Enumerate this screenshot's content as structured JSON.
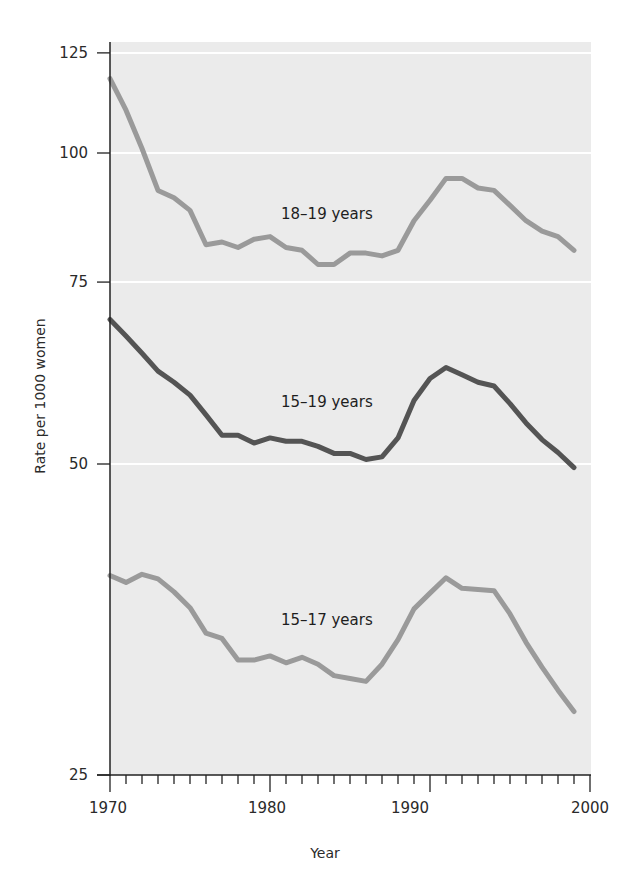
{
  "chart_data": {
    "type": "line",
    "title": "",
    "xlabel": "Year",
    "ylabel": "Rate per 1000 women",
    "y_scale": "log",
    "xlim": [
      1970,
      2000
    ],
    "ylim": [
      25,
      125
    ],
    "x_ticks": [
      1970,
      1980,
      1990,
      2000
    ],
    "x_tick_labels": [
      "1970",
      "1980",
      "1990",
      "2000"
    ],
    "y_ticks": [
      25,
      50,
      75,
      100,
      125
    ],
    "y_tick_labels": [
      "25",
      "50",
      "75",
      "100",
      "125"
    ],
    "grid": "horizontal white lines at y ticks",
    "legend": "inline labels",
    "x": [
      1970,
      1971,
      1972,
      1973,
      1974,
      1975,
      1976,
      1977,
      1978,
      1979,
      1980,
      1981,
      1982,
      1983,
      1984,
      1985,
      1986,
      1987,
      1988,
      1989,
      1990,
      1991,
      1992,
      1993,
      1994,
      1995,
      1996,
      1997,
      1998,
      1999
    ],
    "series": [
      {
        "name": "18–19 years",
        "color": "#9a9a9a",
        "label_position": {
          "x": 1981,
          "y": 87
        },
        "values": [
          118,
          110,
          101,
          92,
          90.5,
          88,
          81.5,
          82,
          81,
          82.5,
          83,
          81,
          80.5,
          78,
          78,
          80,
          80,
          79.5,
          80.5,
          86,
          90,
          94.5,
          94.5,
          92.5,
          92,
          89,
          86,
          84,
          83,
          80.5
        ]
      },
      {
        "name": "15–19 years",
        "color": "#545454",
        "label_position": {
          "x": 1981,
          "y": 60.5
        },
        "values": [
          69,
          66.5,
          64,
          61.5,
          60,
          58.3,
          55.8,
          53.3,
          53.3,
          52.4,
          53,
          52.6,
          52.6,
          52,
          51.2,
          51.2,
          50.5,
          50.8,
          53,
          57.6,
          60.5,
          62,
          61,
          60,
          59.5,
          57.2,
          54.8,
          52.8,
          51.3,
          49.6
        ]
      },
      {
        "name": "15–17 years",
        "color": "#9a9a9a",
        "label_position": {
          "x": 1981,
          "y": 35.5
        },
        "values": [
          39,
          38.4,
          39.1,
          38.7,
          37.6,
          36.3,
          34.3,
          33.9,
          32.3,
          32.3,
          32.6,
          32.1,
          32.5,
          32,
          31.2,
          31,
          30.8,
          32,
          33.8,
          36.2,
          37.5,
          38.8,
          37.9,
          37.8,
          37.7,
          35.8,
          33.6,
          31.8,
          30.2,
          28.8
        ]
      }
    ]
  },
  "labels": {
    "series_1": "18–19 years",
    "series_2": "15–19 years",
    "series_3": "15–17 years",
    "x_axis_title": "Year",
    "y_axis_title": "Rate per 1000 women",
    "x_tick_1970": "1970",
    "x_tick_1980": "1980",
    "x_tick_1990": "1990",
    "x_tick_2000": "2000",
    "y_tick_25": "25",
    "y_tick_50": "50",
    "y_tick_75": "75",
    "y_tick_100": "100",
    "y_tick_125": "125"
  }
}
